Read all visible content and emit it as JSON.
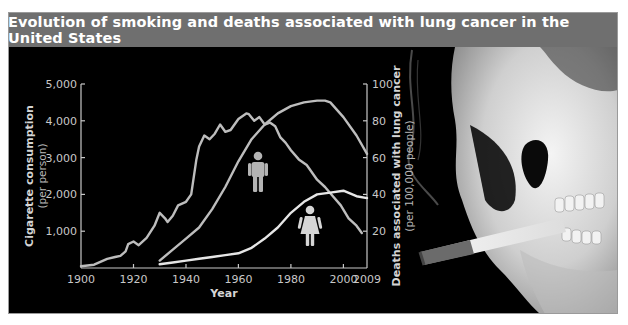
{
  "title": "Evolution of smoking and deaths associated with lung cancer in the United States",
  "chart_data": {
    "type": "line",
    "title": "Evolution of smoking and deaths associated with lung cancer in the United States",
    "xlabel": "Year",
    "x_ticks": [
      "1900",
      "1920",
      "1940",
      "1960",
      "1980",
      "2000",
      "2009"
    ],
    "xlim": [
      1900,
      2009
    ],
    "left_axis": {
      "label": "Cigarette consumption",
      "sublabel": "(per person)",
      "ticks": [
        "1,000",
        "2,000",
        "3,000",
        "4,000",
        "5,000"
      ],
      "ylim": [
        0,
        5000
      ]
    },
    "right_axis": {
      "label": "Deaths associated with lung cancer",
      "sublabel": "(per 100,000 people)",
      "ticks": [
        "20",
        "40",
        "60",
        "80",
        "100"
      ],
      "ylim": [
        0,
        100
      ]
    },
    "grid": false,
    "legend": "icons (man icon near men's curve, woman icon near women's curve)",
    "series": [
      {
        "name": "Cigarette consumption (per person)",
        "axis": "left",
        "x": [
          1900,
          1905,
          1910,
          1913,
          1915,
          1917,
          1918,
          1920,
          1922,
          1925,
          1928,
          1930,
          1932,
          1933,
          1935,
          1937,
          1940,
          1942,
          1944,
          1945,
          1947,
          1949,
          1951,
          1953,
          1955,
          1957,
          1960,
          1963,
          1964,
          1966,
          1968,
          1970,
          1972,
          1974,
          1976,
          1978,
          1980,
          1983,
          1986,
          1990,
          1993,
          1996,
          1999,
          2002,
          2005,
          2007
        ],
        "values": [
          50,
          90,
          250,
          300,
          330,
          450,
          650,
          720,
          620,
          820,
          1150,
          1500,
          1350,
          1250,
          1420,
          1700,
          1800,
          2000,
          2950,
          3300,
          3600,
          3500,
          3650,
          3900,
          3700,
          3750,
          4050,
          4200,
          4180,
          4000,
          4100,
          3900,
          3950,
          3850,
          3550,
          3400,
          3200,
          2950,
          2800,
          2400,
          2200,
          1950,
          1700,
          1350,
          1150,
          950
        ]
      },
      {
        "name": "Lung cancer deaths — men (per 100,000)",
        "axis": "right",
        "x": [
          1930,
          1935,
          1940,
          1945,
          1950,
          1955,
          1960,
          1965,
          1970,
          1975,
          1980,
          1985,
          1990,
          1993,
          1995,
          2000,
          2005,
          2009
        ],
        "values": [
          4,
          10,
          16,
          22,
          32,
          44,
          58,
          70,
          78,
          84,
          88,
          90,
          91,
          91,
          90,
          82,
          72,
          62
        ]
      },
      {
        "name": "Lung cancer deaths — women (per 100,000)",
        "axis": "right",
        "x": [
          1930,
          1935,
          1940,
          1945,
          1950,
          1955,
          1960,
          1965,
          1970,
          1975,
          1980,
          1985,
          1990,
          1995,
          2000,
          2005,
          2009
        ],
        "values": [
          2,
          3,
          4,
          5,
          6,
          7,
          8,
          11,
          16,
          22,
          30,
          36,
          40,
          41,
          42,
          39,
          38
        ]
      }
    ]
  },
  "icons": {
    "men": "man-icon",
    "women": "woman-icon",
    "illustration": "skull-smoking-cigarette"
  },
  "colors": {
    "title_bar": "#6f6f6f",
    "background": "#000000",
    "line": "#bdbdbd",
    "women_line": "#e6e6e6",
    "text": "#c8c8c8"
  }
}
